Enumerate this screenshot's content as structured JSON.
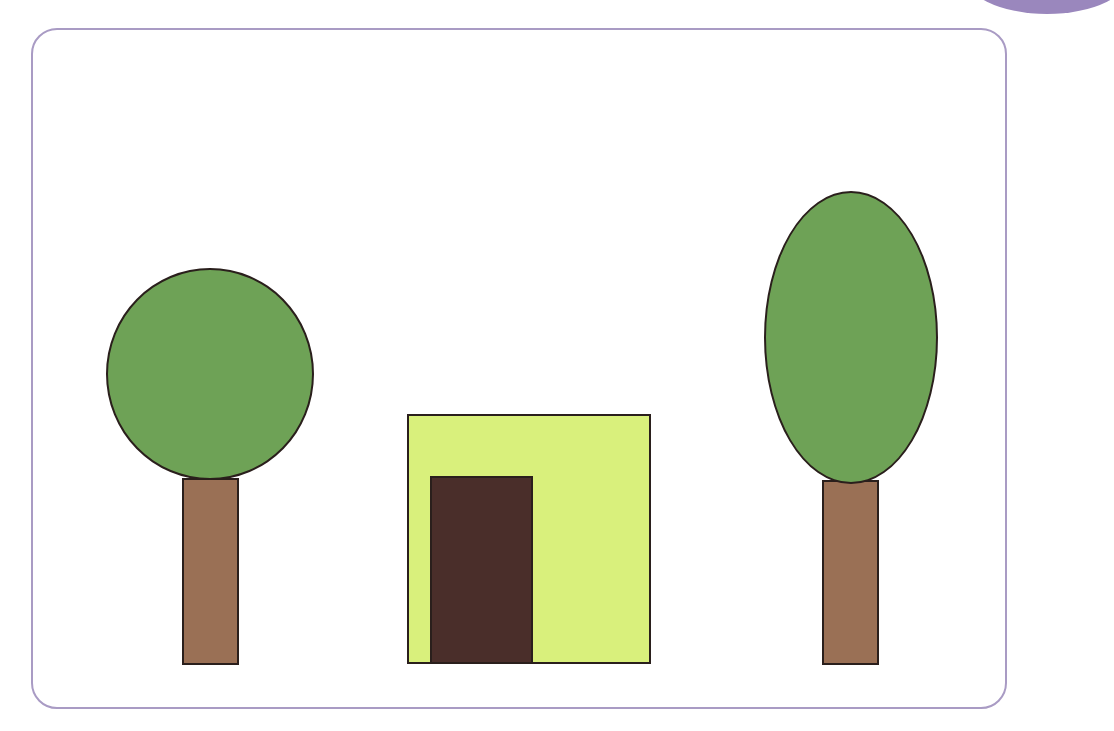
{
  "scene": {
    "description": "Two trees (one round crown, one oval crown) flanking a square house with a door",
    "colors": {
      "frame_border": "#a99bc4",
      "corner_tab": "#9a87bd",
      "foliage": "#6ea256",
      "trunk": "#9a7055",
      "house_wall": "#d9f07c",
      "door": "#4a2e2a",
      "outline": "#2a1f1c"
    },
    "shapes": [
      {
        "id": "left-tree-crown",
        "type": "circle",
        "x": 106,
        "y": 268,
        "w": 208,
        "h": 212
      },
      {
        "id": "left-tree-trunk",
        "type": "rect",
        "x": 182,
        "y": 478,
        "w": 57,
        "h": 187
      },
      {
        "id": "house-wall",
        "type": "rect",
        "x": 407,
        "y": 414,
        "w": 244,
        "h": 250
      },
      {
        "id": "house-door",
        "type": "rect",
        "x": 430,
        "y": 476,
        "w": 103,
        "h": 188
      },
      {
        "id": "right-tree-crown",
        "type": "ellipse",
        "x": 764,
        "y": 191,
        "w": 174,
        "h": 293
      },
      {
        "id": "right-tree-trunk",
        "type": "rect",
        "x": 822,
        "y": 480,
        "w": 57,
        "h": 185
      }
    ]
  }
}
